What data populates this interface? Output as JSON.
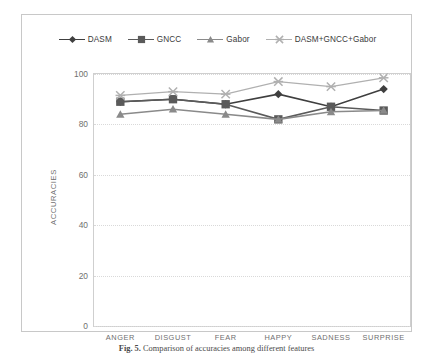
{
  "chart_data": {
    "type": "line",
    "title": "",
    "xlabel": "",
    "ylabel": "ACCURACIES",
    "categories": [
      "ANGER",
      "DISGUST",
      "FEAR",
      "HAPPY",
      "SADNESS",
      "SURPRISE"
    ],
    "ylim": [
      0,
      100
    ],
    "yticks": [
      0,
      20,
      40,
      60,
      80,
      100
    ],
    "grid": true,
    "legend_position": "top-center",
    "series": [
      {
        "name": "DASM",
        "marker": "diamond",
        "color": "#3f3f3f",
        "values": [
          89,
          90,
          88,
          92,
          87,
          94
        ]
      },
      {
        "name": "GNCC",
        "marker": "square",
        "color": "#5a5a5a",
        "values": [
          89,
          90,
          88,
          82,
          87,
          85.5
        ]
      },
      {
        "name": "Gabor",
        "marker": "triangle",
        "color": "#8a8a8a",
        "values": [
          84,
          86,
          84,
          82,
          85,
          85.5
        ]
      },
      {
        "name": "DASM+GNCC+Gabor",
        "marker": "star",
        "color": "#b0b0b0",
        "values": [
          91.5,
          93,
          92,
          97,
          95,
          98.5
        ]
      }
    ]
  },
  "caption": {
    "figure_number": "Fig. 5.",
    "text": "Comparison of accuracies among different features"
  }
}
